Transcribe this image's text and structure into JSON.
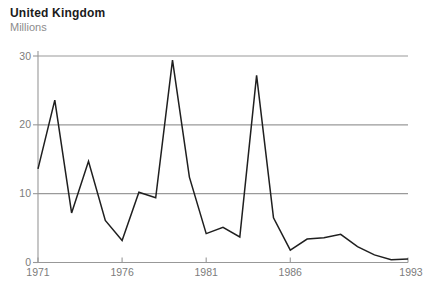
{
  "header": {
    "title": "United Kingdom",
    "subtitle": "Millions"
  },
  "chart_data": {
    "type": "line",
    "title": "United Kingdom",
    "ylabel": "Millions",
    "x": [
      1971,
      1972,
      1973,
      1974,
      1975,
      1976,
      1977,
      1978,
      1979,
      1980,
      1981,
      1982,
      1983,
      1984,
      1985,
      1986,
      1987,
      1988,
      1989,
      1990,
      1991,
      1992,
      1993
    ],
    "values": [
      13.6,
      23.6,
      7.2,
      14.7,
      6.1,
      3.2,
      10.2,
      9.4,
      29.4,
      12.4,
      4.2,
      5.1,
      3.7,
      27.2,
      6.5,
      1.8,
      3.4,
      3.6,
      4.1,
      2.3,
      1.1,
      0.4,
      0.5
    ],
    "xlim": [
      1971,
      1993
    ],
    "ylim": [
      0,
      30
    ],
    "yticks": [
      0,
      10,
      20,
      30
    ],
    "ytick_labels": [
      "0",
      "10",
      "20",
      "30"
    ],
    "xticks": [
      1971,
      1976,
      1981,
      1986,
      1993
    ],
    "xtick_labels": [
      "1971",
      "1976",
      "1981",
      "1986",
      "1993"
    ],
    "grid": "horizontal",
    "legend": "none",
    "colors": {
      "line": "#1f1f1f",
      "axis": "#989898",
      "grid": "#9a9a9a",
      "tick_label": "#7c7c7c"
    }
  }
}
